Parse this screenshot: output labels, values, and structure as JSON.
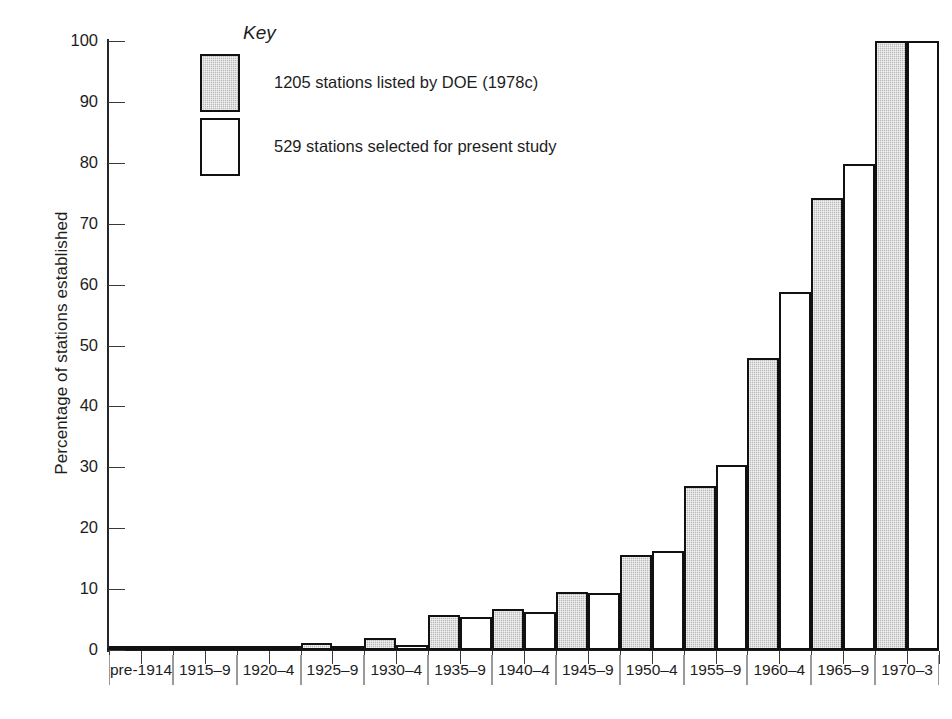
{
  "chart_data": {
    "type": "bar",
    "title": "",
    "xlabel": "",
    "ylabel": "Percentage of stations established",
    "ylim": [
      0,
      100
    ],
    "yticks": [
      0,
      10,
      20,
      30,
      40,
      50,
      60,
      70,
      80,
      90,
      100
    ],
    "ytick_labels": [
      "0",
      "10",
      "20",
      "30",
      "40",
      "50",
      "60",
      "70",
      "80",
      "90",
      "100"
    ],
    "grid": false,
    "legend_position": "upper-left-inside",
    "legend_title": "Key",
    "categories": [
      "pre-1914",
      "1915–9",
      "1920–4",
      "1925–9",
      "1930–4",
      "1935–9",
      "1940–4",
      "1945–9",
      "1950–4",
      "1955–9",
      "1960–4",
      "1965–9",
      "1970–3"
    ],
    "series": [
      {
        "name": "1205 stations listed by DOE (1978c)",
        "style": "shaded",
        "color": "#b9b9b9",
        "values": [
          0.3,
          0.4,
          0.6,
          1.2,
          1.9,
          5.8,
          6.8,
          9.5,
          15.6,
          27.0,
          47.9,
          74.3,
          100.0
        ]
      },
      {
        "name": "529 stations selected for present study",
        "style": "open",
        "color": "#ffffff",
        "values": [
          0.2,
          0.3,
          0.5,
          0.6,
          0.8,
          5.5,
          6.2,
          9.4,
          16.3,
          30.4,
          58.8,
          79.8,
          100.0
        ]
      }
    ]
  },
  "legend": {
    "title": "Key",
    "entries": [
      {
        "swatch": "shaded",
        "label": "1205 stations listed by DOE (1978c)"
      },
      {
        "swatch": "open",
        "label": "529 stations selected for present study"
      }
    ]
  },
  "axes": {
    "y_title": "Percentage of stations established"
  }
}
